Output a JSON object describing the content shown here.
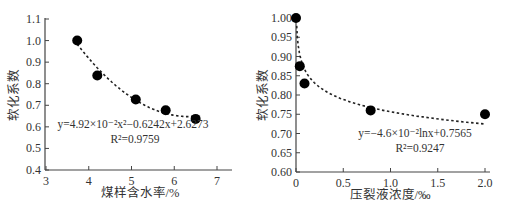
{
  "chart_data": [
    {
      "type": "scatter",
      "title": "",
      "xlabel": "煤样含水率/%",
      "ylabel": "软化系数",
      "xlim": [
        3,
        7
      ],
      "ylim": [
        0.4,
        1.1
      ],
      "xticks": [
        "3",
        "4",
        "5",
        "6",
        "7"
      ],
      "yticks": [
        "0.4",
        "0.5",
        "0.6",
        "0.7",
        "0.8",
        "0.9",
        "1.0",
        "1.1"
      ],
      "grid": false,
      "series": [
        {
          "name": "measured",
          "x": [
            3.73,
            4.2,
            5.1,
            5.8,
            6.5
          ],
          "y": [
            1.0,
            0.838,
            0.727,
            0.677,
            0.637
          ]
        }
      ],
      "fit": {
        "type": "quadratic",
        "equation": "y=4.92×10⁻²x²−0.6242x+2.6273",
        "r2": "R²=0.9759",
        "a": 0.0492,
        "b": -0.6242,
        "c": 2.6273,
        "x_range": [
          3.73,
          6.5
        ]
      }
    },
    {
      "type": "scatter",
      "title": "",
      "xlabel": "压裂液浓度/‰",
      "ylabel": "软化系数",
      "xlim": [
        0,
        2.0
      ],
      "ylim": [
        0.6,
        1.0
      ],
      "xticks": [
        "0",
        "0.5",
        "1.0",
        "1.5",
        "2.0"
      ],
      "yticks": [
        "0.60",
        "0.65",
        "0.70",
        "0.75",
        "0.80",
        "0.85",
        "0.90",
        "0.95",
        "1.00"
      ],
      "grid": false,
      "series": [
        {
          "name": "measured",
          "x": [
            0,
            0.04,
            0.09,
            0.79,
            2.0
          ],
          "y": [
            1.0,
            0.875,
            0.83,
            0.76,
            0.75
          ]
        }
      ],
      "fit": {
        "type": "logarithmic",
        "equation": "y=−4.6×10⁻²lnx+0.7565",
        "r2": "R²=0.9247",
        "a": -0.046,
        "b": 0.7565,
        "x_range": [
          0.005,
          2.0
        ]
      }
    }
  ],
  "labels": {
    "left": {
      "ylabel": "软化系数",
      "xlabel": "煤样含水率/%",
      "eq": "y=4.92×10⁻²x²−0.6242x+2.6273",
      "r2": "R²=0.9759"
    },
    "right": {
      "ylabel": "软化系数",
      "xlabel": "压裂液浓度/‰",
      "eq": "y=−4.6×10⁻²lnx+0.7565",
      "r2": "R²=0.9247"
    }
  }
}
